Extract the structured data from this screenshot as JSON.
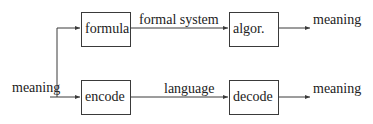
{
  "diagram": {
    "colors": {
      "stroke": "#3a3a3a",
      "text": "#222222",
      "background": "#ffffff"
    },
    "input_label": "meaning",
    "top_row": {
      "box1": "formula",
      "edge_label": "formal system",
      "box2": "algor.",
      "output_label": "meaning"
    },
    "bottom_row": {
      "box1": "encode",
      "edge_label": "language",
      "box2": "decode",
      "output_label": "meaning"
    }
  }
}
